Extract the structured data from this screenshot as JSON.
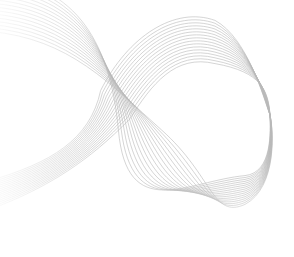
{
  "artwork": {
    "kind": "abstract-infinity-ribbon",
    "background": "#ffffff",
    "stroke_color": "#b8b8b8",
    "stroke_color_faded": "#dcdcdc",
    "strand_count": 16,
    "strand_spacing": 3.2
  }
}
